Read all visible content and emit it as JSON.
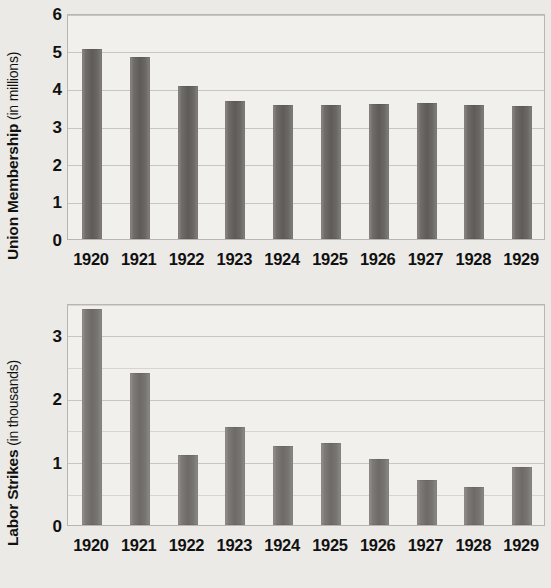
{
  "figure": {
    "background_color": "#eceae6",
    "bar_color": "#6b6865",
    "grid_color": "#c9c6c1",
    "plot_background": "#f2f0ed"
  },
  "charts": [
    {
      "id": "union-membership",
      "ylabel_bold": "Union Membership",
      "ylabel_light": " (in millions)",
      "yticks": [
        "0",
        "1",
        "2",
        "3",
        "4",
        "5",
        "6"
      ],
      "xlabels": [
        "1920",
        "1921",
        "1922",
        "1923",
        "1924",
        "1925",
        "1926",
        "1927",
        "1928",
        "1929"
      ]
    },
    {
      "id": "labor-strikes",
      "ylabel_bold": "Labor Strikes",
      "ylabel_light": " (in thousands)",
      "yticks": [
        "0",
        "1",
        "2",
        "3"
      ],
      "xlabels": [
        "1920",
        "1921",
        "1922",
        "1923",
        "1924",
        "1925",
        "1926",
        "1927",
        "1928",
        "1929"
      ]
    }
  ],
  "chart_data": [
    {
      "type": "bar",
      "id": "union-membership",
      "title": "",
      "xlabel": "",
      "ylabel": "Union Membership (in millions)",
      "categories": [
        "1920",
        "1921",
        "1922",
        "1923",
        "1924",
        "1925",
        "1926",
        "1927",
        "1928",
        "1929"
      ],
      "values": [
        5.05,
        4.82,
        4.07,
        3.67,
        3.57,
        3.57,
        3.58,
        3.6,
        3.55,
        3.52
      ],
      "ylim": [
        0,
        6
      ],
      "ytick_values": [
        0,
        1,
        2,
        3,
        4,
        5,
        6
      ],
      "grid": true,
      "grid_axis": "y",
      "legend": false,
      "units": "millions"
    },
    {
      "type": "bar",
      "id": "labor-strikes",
      "title": "",
      "xlabel": "",
      "ylabel": "Labor Strikes (in thousands)",
      "categories": [
        "1920",
        "1921",
        "1922",
        "1923",
        "1924",
        "1925",
        "1926",
        "1927",
        "1928",
        "1929"
      ],
      "values": [
        3.41,
        2.39,
        1.11,
        1.55,
        1.25,
        1.3,
        1.04,
        0.71,
        0.6,
        0.92
      ],
      "ylim": [
        0,
        3.5
      ],
      "ytick_values": [
        0,
        1,
        2,
        3
      ],
      "minor_tick_step": 0.5,
      "grid": true,
      "grid_axis": "y",
      "legend": false,
      "units": "thousands"
    }
  ]
}
